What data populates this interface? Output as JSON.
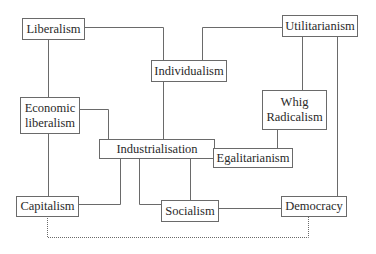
{
  "diagram": {
    "nodes": [
      {
        "id": "liberalism",
        "label": "Liberalism"
      },
      {
        "id": "individualism",
        "label": "Individualism"
      },
      {
        "id": "utilitarianism",
        "label": "Utilitarianism"
      },
      {
        "id": "economic_liberalism",
        "label": "Economic\nliberalism"
      },
      {
        "id": "whig_radicalism",
        "label": "Whig\nRadicalism"
      },
      {
        "id": "industrialisation",
        "label": "Industrialisation"
      },
      {
        "id": "egalitarianism",
        "label": "Egalitarianism"
      },
      {
        "id": "capitalism",
        "label": "Capitalism"
      },
      {
        "id": "socialism",
        "label": "Socialism"
      },
      {
        "id": "democracy",
        "label": "Democracy"
      }
    ],
    "edges": [
      {
        "from": "liberalism",
        "to": "individualism",
        "style": "solid"
      },
      {
        "from": "liberalism",
        "to": "economic_liberalism",
        "style": "solid"
      },
      {
        "from": "utilitarianism",
        "to": "individualism",
        "style": "solid"
      },
      {
        "from": "utilitarianism",
        "to": "whig_radicalism",
        "style": "solid"
      },
      {
        "from": "utilitarianism",
        "to": "democracy",
        "style": "solid"
      },
      {
        "from": "individualism",
        "to": "industrialisation",
        "style": "solid"
      },
      {
        "from": "economic_liberalism",
        "to": "industrialisation",
        "style": "solid"
      },
      {
        "from": "economic_liberalism",
        "to": "capitalism",
        "style": "solid"
      },
      {
        "from": "whig_radicalism",
        "to": "egalitarianism",
        "style": "solid"
      },
      {
        "from": "egalitarianism",
        "to": "socialism",
        "style": "solid"
      },
      {
        "from": "industrialisation",
        "to": "capitalism",
        "style": "solid"
      },
      {
        "from": "industrialisation",
        "to": "socialism",
        "style": "solid"
      },
      {
        "from": "socialism",
        "to": "democracy",
        "style": "solid"
      },
      {
        "from": "capitalism",
        "to": "democracy",
        "style": "dotted"
      }
    ],
    "colors": {
      "line": "#6a6a6a",
      "text": "#2a2a2a",
      "background": "#ffffff"
    }
  }
}
